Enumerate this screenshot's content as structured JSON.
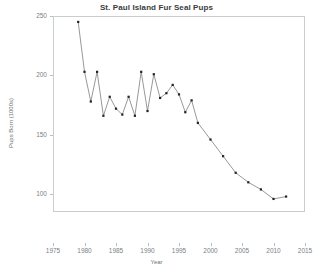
{
  "chart_data": {
    "type": "line",
    "title": "St. Paul Island Fur Seal Pups",
    "xlabel": "Year",
    "ylabel": "Pups Born (1000s)",
    "xlim": [
      1975,
      2015
    ],
    "ylim": [
      85,
      250
    ],
    "grid": false,
    "legend": null,
    "marker": "filled-square",
    "line_color": "#6b6b6b",
    "marker_color": "#222222",
    "xticks": [
      1975,
      1980,
      1985,
      1990,
      1995,
      2000,
      2005,
      2010,
      2015
    ],
    "yticks": [
      100,
      150,
      200,
      250
    ],
    "x": [
      1979,
      1980,
      1981,
      1982,
      1983,
      1984,
      1985,
      1986,
      1987,
      1988,
      1989,
      1990,
      1991,
      1992,
      1993,
      1994,
      1995,
      1996,
      1997,
      1998,
      2000,
      2002,
      2004,
      2006,
      2008,
      2010,
      2012
    ],
    "values": [
      245,
      203,
      178,
      203,
      166,
      182,
      172,
      167,
      182,
      166,
      203,
      170,
      201,
      181,
      185,
      192,
      184,
      169,
      179,
      160,
      146,
      132,
      118,
      110,
      104,
      96,
      98
    ],
    "series": [
      {
        "name": "Pups Born (1000s)",
        "values": [
          245,
          203,
          178,
          203,
          166,
          182,
          172,
          167,
          182,
          166,
          203,
          170,
          201,
          181,
          185,
          192,
          184,
          169,
          179,
          160,
          146,
          132,
          118,
          110,
          104,
          96,
          98
        ]
      }
    ]
  }
}
